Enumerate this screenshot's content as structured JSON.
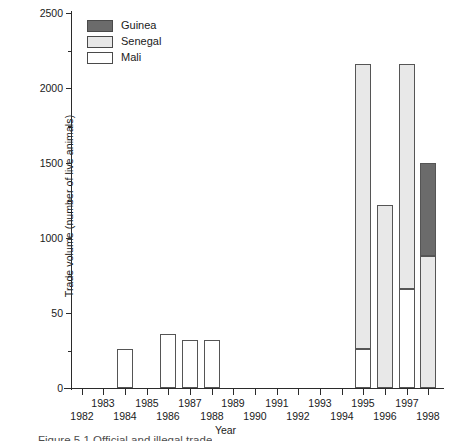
{
  "chart_data": {
    "type": "bar",
    "stacked": true,
    "title": "",
    "xlabel": "Year",
    "ylabel": "Trade volume (number of live animals)",
    "categories": [
      "1982",
      "1983",
      "1984",
      "1985",
      "1986",
      "1987",
      "1988",
      "1989",
      "1990",
      "1991",
      "1992",
      "1993",
      "1994",
      "1995",
      "1996",
      "1997",
      "1998"
    ],
    "series": [
      {
        "name": "Mali",
        "color": "#ffffff",
        "values": [
          0,
          0,
          260,
          0,
          360,
          320,
          320,
          0,
          0,
          0,
          0,
          0,
          0,
          260,
          0,
          660,
          0
        ]
      },
      {
        "name": "Senegal",
        "color": "#e8e8e8",
        "values": [
          0,
          0,
          0,
          0,
          0,
          0,
          0,
          0,
          0,
          0,
          0,
          0,
          0,
          1900,
          1220,
          1500,
          880
        ]
      },
      {
        "name": "Guinea",
        "color": "#6b6b6b",
        "values": [
          0,
          0,
          0,
          0,
          0,
          0,
          0,
          0,
          0,
          0,
          0,
          0,
          0,
          0,
          0,
          0,
          620
        ]
      }
    ],
    "totals": [
      0,
      0,
      260,
      0,
      360,
      320,
      320,
      0,
      0,
      0,
      0,
      0,
      0,
      2160,
      1220,
      2160,
      1500
    ],
    "ylim": [
      0,
      2500
    ],
    "y_major_ticks": [
      0,
      500,
      1000,
      1500,
      2000,
      2500
    ],
    "y_major_tick_labels": [
      "0",
      "50",
      "1000",
      "1500",
      "2000",
      "2500"
    ],
    "y_minor_ticks": [
      250,
      750,
      1250,
      1750,
      2250
    ],
    "grid": false,
    "legend_position": "top-left",
    "legend_order": [
      "Guinea",
      "Senegal",
      "Mali"
    ]
  },
  "axes": {
    "y_title": "Trade volume (number of live animals)",
    "x_title": "Year",
    "y_labels": [
      "2500",
      "2000",
      "1500",
      "1000",
      "50",
      "0"
    ],
    "x_labels": [
      "1982",
      "1983",
      "1984",
      "1985",
      "1986",
      "1987",
      "1988",
      "1989",
      "1990",
      "1991",
      "1992",
      "1993",
      "1994",
      "1995",
      "1996",
      "1997",
      "1998"
    ]
  },
  "legend": {
    "items": [
      {
        "label": "Guinea",
        "color": "#6b6b6b"
      },
      {
        "label": "Senegal",
        "color": "#e8e8e8"
      },
      {
        "label": "Mali",
        "color": "#ffffff"
      }
    ]
  },
  "caption": {
    "text": "Figure 5.1 Official and illegal trade"
  }
}
